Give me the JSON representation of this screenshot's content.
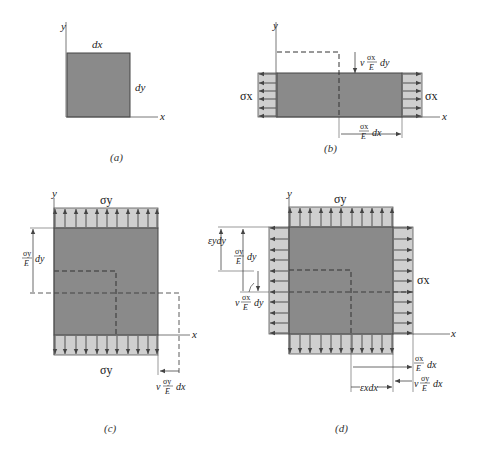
{
  "figure": {
    "colors": {
      "element": "#8a8a8a",
      "stress_block": "#cfcfcf",
      "line": "#444444",
      "axis": "#555555"
    },
    "panels": [
      {
        "id": "a",
        "caption": "(a)",
        "labels": {
          "x_axis": "x",
          "y_axis": "y",
          "width": "dx",
          "height": "dy"
        }
      },
      {
        "id": "b",
        "caption": "(b)",
        "labels": {
          "x_axis": "x",
          "y_axis": "y",
          "stress_left": "σx",
          "stress_right": "σx",
          "lateral_contraction": {
            "prefix": "v",
            "num": "σx",
            "den": "E",
            "suffix": "dy"
          },
          "elongation": {
            "num": "σx",
            "den": "E",
            "suffix": "dx"
          }
        }
      },
      {
        "id": "c",
        "caption": "(c)",
        "labels": {
          "x_axis": "x",
          "y_axis": "y",
          "stress_top": "σy",
          "stress_bottom": "σy",
          "elongation": {
            "num": "σy",
            "den": "E",
            "suffix": "dy"
          },
          "lateral_contraction": {
            "prefix": "v",
            "num": "σy",
            "den": "E",
            "suffix": "dx"
          }
        }
      },
      {
        "id": "d",
        "caption": "(d)",
        "labels": {
          "x_axis": "x",
          "y_axis": "y",
          "stress_top": "σy",
          "stress_right": "σx",
          "strain_y": "εydy",
          "elongation_y": {
            "num": "σy",
            "den": "E",
            "suffix": "dy"
          },
          "contraction_y": {
            "prefix": "v",
            "num": "σx",
            "den": "E",
            "suffix": "dy"
          },
          "elongation_x": {
            "num": "σx",
            "den": "E",
            "suffix": "dx"
          },
          "contraction_x": {
            "prefix": "v",
            "num": "σy",
            "den": "E",
            "suffix": "dx"
          },
          "strain_x": "εxdx"
        }
      }
    ]
  }
}
